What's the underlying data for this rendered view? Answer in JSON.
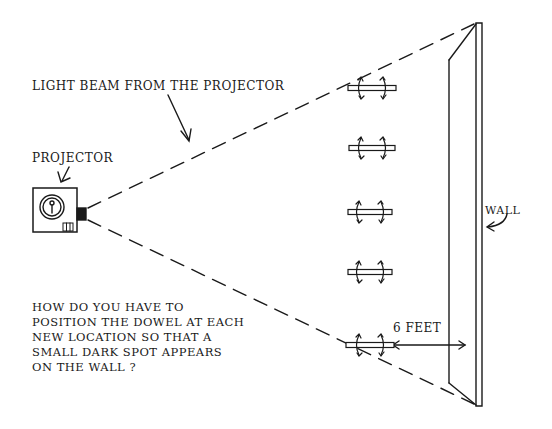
{
  "labels": {
    "light_beam": "LIGHT BEAM FROM THE PROJECTOR",
    "projector": "PROJECTOR",
    "wall": "WALL",
    "distance": "6 FEET"
  },
  "question": {
    "lines": [
      "HOW DO YOU HAVE TO",
      "POSITION THE DOWEL AT EACH",
      "NEW LOCATION SO THAT A",
      "SMALL DARK SPOT APPEARS",
      "ON THE WALL ?"
    ]
  },
  "dowels": [
    {
      "id": 1,
      "cx": 372,
      "cy": 88
    },
    {
      "id": 2,
      "cx": 372,
      "cy": 148
    },
    {
      "id": 3,
      "cx": 370,
      "cy": 212
    },
    {
      "id": 4,
      "cx": 370,
      "cy": 272
    },
    {
      "id": 5,
      "cx": 370,
      "cy": 345
    }
  ],
  "colors": {
    "ink": "#1a1a1a",
    "background": "#ffffff"
  }
}
